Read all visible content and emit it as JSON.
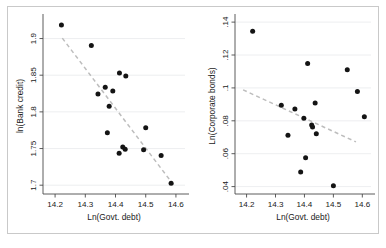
{
  "figure": {
    "background_color": "#ffffff",
    "border_color": "#c9c9c9",
    "marker_color": "#141414",
    "trendline_color": "#bdbdbd",
    "gridline_color": "#e8eaec",
    "axis_color": "#4a4a4a"
  },
  "chart_data": [
    {
      "type": "scatter",
      "panel": "left",
      "title": "",
      "xlabel": "Ln(Govt. debt)",
      "ylabel": "ln(Bank credit)",
      "xlim": [
        14.16,
        14.63
      ],
      "ylim": [
        1.688,
        1.928
      ],
      "xticks": [
        14.2,
        14.3,
        14.4,
        14.5,
        14.6
      ],
      "xticklabels": [
        "14.2",
        "14.3",
        "14.4",
        "14.5",
        "14.6"
      ],
      "yticks": [
        1.7,
        1.75,
        1.8,
        1.85,
        1.9
      ],
      "yticklabels": [
        "1.7",
        "1.75",
        "1.8",
        "1.85",
        "1.9"
      ],
      "grid": true,
      "grid_axis": "y",
      "legend": "none",
      "points": [
        {
          "x": 14.221,
          "y": 1.9185
        },
        {
          "x": 14.32,
          "y": 1.8905
        },
        {
          "x": 14.413,
          "y": 1.853
        },
        {
          "x": 14.434,
          "y": 1.849
        },
        {
          "x": 14.366,
          "y": 1.8335
        },
        {
          "x": 14.391,
          "y": 1.8285
        },
        {
          "x": 14.342,
          "y": 1.8245
        },
        {
          "x": 14.379,
          "y": 1.8075
        },
        {
          "x": 14.5,
          "y": 1.7785
        },
        {
          "x": 14.373,
          "y": 1.7715
        },
        {
          "x": 14.424,
          "y": 1.752
        },
        {
          "x": 14.432,
          "y": 1.749
        },
        {
          "x": 14.493,
          "y": 1.7485
        },
        {
          "x": 14.412,
          "y": 1.7435
        },
        {
          "x": 14.551,
          "y": 1.7405
        },
        {
          "x": 14.584,
          "y": 1.7025
        }
      ],
      "trendline": {
        "x0": 14.224,
        "y0": 1.9005,
        "x1": 14.592,
        "y1": 1.7005
      }
    },
    {
      "type": "scatter",
      "panel": "right",
      "title": "",
      "xlabel": "Ln(Govt. debt)",
      "ylabel": "Ln(Corporate bonds)",
      "xlim": [
        14.16,
        14.63
      ],
      "ylim": [
        0.0355,
        0.1425
      ],
      "xticks": [
        14.2,
        14.3,
        14.4,
        14.5,
        14.6
      ],
      "xticklabels": [
        "14.2",
        "14.3",
        "14.4",
        "14.5",
        "14.6"
      ],
      "yticks": [
        0.04,
        0.06,
        0.08,
        0.1,
        0.12,
        0.14
      ],
      "yticklabels": [
        ".04",
        ".06",
        ".08",
        ".1",
        ".12",
        ".14"
      ],
      "grid": true,
      "grid_axis": "y",
      "legend": "none",
      "points": [
        {
          "x": 14.221,
          "y": 0.1345
        },
        {
          "x": 14.411,
          "y": 0.1148
        },
        {
          "x": 14.548,
          "y": 0.111
        },
        {
          "x": 14.583,
          "y": 0.0978
        },
        {
          "x": 14.32,
          "y": 0.0895
        },
        {
          "x": 14.437,
          "y": 0.0908
        },
        {
          "x": 14.367,
          "y": 0.0872
        },
        {
          "x": 14.398,
          "y": 0.0815
        },
        {
          "x": 14.607,
          "y": 0.0825
        },
        {
          "x": 14.425,
          "y": 0.0775
        },
        {
          "x": 14.428,
          "y": 0.0762
        },
        {
          "x": 14.343,
          "y": 0.0712
        },
        {
          "x": 14.441,
          "y": 0.0722
        },
        {
          "x": 14.404,
          "y": 0.0575
        },
        {
          "x": 14.387,
          "y": 0.0488
        },
        {
          "x": 14.5,
          "y": 0.0405
        }
      ],
      "trendline": {
        "x0": 14.188,
        "y0": 0.0988,
        "x1": 14.578,
        "y1": 0.0672
      }
    }
  ]
}
